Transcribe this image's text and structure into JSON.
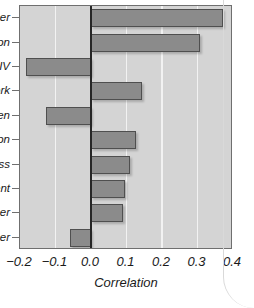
{
  "chart_data": {
    "type": "bar",
    "orientation": "horizontal",
    "title": "",
    "subtitle": "",
    "xlabel": "Correlation",
    "ylabel": "",
    "xlim": [
      -0.2,
      0.4
    ],
    "ylim": [
      0,
      10
    ],
    "grid": true,
    "gridlines_x": [
      -0.1,
      0.1,
      0.2,
      0.3
    ],
    "zero_line": 0.0,
    "legend": null,
    "legend_position": "none",
    "xticks": [
      -0.2,
      -0.1,
      0.0,
      0.1,
      0.2,
      0.3,
      0.4
    ],
    "xticklabels": [
      "-0.2",
      "-0.1",
      "0.0",
      "0.1",
      "0.2",
      "0.3",
      "0.4"
    ],
    "categories": [
      "cer",
      "on",
      "IV",
      "ork",
      "en",
      "on",
      "ss",
      "ent",
      "er",
      "er"
    ],
    "values": [
      0.371,
      0.307,
      -0.184,
      0.145,
      -0.128,
      0.128,
      0.11,
      0.097,
      0.089,
      -0.06
    ],
    "series": [
      {
        "name": "Correlation",
        "values": [
          0.371,
          0.307,
          -0.184,
          0.145,
          -0.128,
          0.128,
          0.11,
          0.097,
          0.089,
          -0.06
        ]
      }
    ],
    "colors": {
      "bar_fill": "#8b8b8b",
      "bar_edge": "#4f4f4f",
      "plot_background": "#d4d4d4",
      "gridline": "#f2f2f2",
      "zero_line": "#262626",
      "axis": "#6f6f6f",
      "text": "#1a1a1a",
      "figure_background": "#ffffff"
    }
  },
  "axis": {
    "x_title": "Correlation"
  }
}
